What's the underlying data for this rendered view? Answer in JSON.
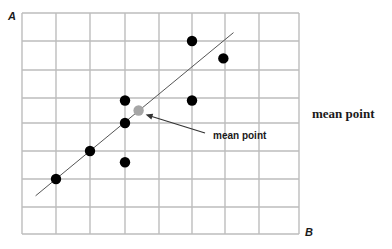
{
  "figure": {
    "y_axis_label": "A",
    "x_axis_label": "B",
    "annotation_label": "mean point",
    "side_caption": "mean point"
  },
  "colors": {
    "grid": "#bdbdbd",
    "point": "#000000",
    "mean_point": "#a6a6a6",
    "fit_line": "#555555",
    "arrow": "#333333",
    "text": "#1a1a1a"
  },
  "chart_data": {
    "type": "scatter",
    "title": "",
    "xlabel": "B",
    "ylabel": "A",
    "grid": true,
    "grid_columns": 8,
    "grid_rows": 8,
    "xlim": [
      0,
      8
    ],
    "ylim": [
      0,
      8
    ],
    "series": [
      {
        "name": "data points",
        "points": [
          {
            "x": 1.0,
            "y": 2.0
          },
          {
            "x": 2.0,
            "y": 3.0
          },
          {
            "x": 3.0,
            "y": 2.6
          },
          {
            "x": 3.0,
            "y": 4.0
          },
          {
            "x": 3.0,
            "y": 4.9
          },
          {
            "x": 5.0,
            "y": 4.9
          },
          {
            "x": 5.0,
            "y": 7.0
          },
          {
            "x": 5.95,
            "y": 6.4
          }
        ]
      },
      {
        "name": "mean point",
        "points": [
          {
            "x": 3.4,
            "y": 4.5
          }
        ]
      }
    ],
    "fit_line": {
      "x1": 0.4,
      "y1": 1.4,
      "x2": 6.25,
      "y2": 7.3
    },
    "annotations": [
      {
        "text": "mean point",
        "target": {
          "x": 3.4,
          "y": 4.5
        },
        "arrow": true
      }
    ]
  }
}
